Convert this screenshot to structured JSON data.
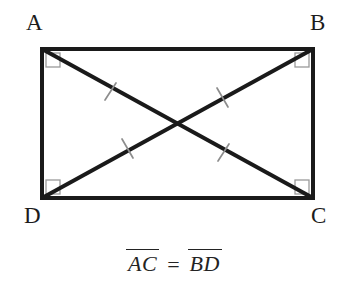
{
  "figure": {
    "shape": "rectangle",
    "background_color": "#ffffff",
    "stroke_color": "#1a1a1a",
    "right_angle_marker_color": "#9a9a9a",
    "tick_mark_color": "#8d8d8d",
    "rect": {
      "left": 42,
      "top": 49,
      "right": 313,
      "bottom": 198,
      "width": 271,
      "height": 149,
      "stroke_width": 4
    },
    "vertices": [
      {
        "name": "A",
        "label": "A",
        "position": "top-left",
        "x": 42,
        "y": 49,
        "right_angle": true
      },
      {
        "name": "B",
        "label": "B",
        "position": "top-right",
        "x": 313,
        "y": 49,
        "right_angle": true
      },
      {
        "name": "C",
        "label": "C",
        "position": "bottom-right",
        "x": 313,
        "y": 198,
        "right_angle": true
      },
      {
        "name": "D",
        "label": "D",
        "position": "bottom-left",
        "x": 42,
        "y": 198,
        "right_angle": true
      }
    ],
    "diagonals": [
      {
        "name": "AC",
        "from": "A",
        "to": "C",
        "stroke_width": 4,
        "tick_count": 2
      },
      {
        "name": "BD",
        "from": "B",
        "to": "D",
        "stroke_width": 4,
        "tick_count": 2
      }
    ],
    "intersection": {
      "x": 177,
      "y": 123
    },
    "tick_marks": [
      {
        "on_diagonal": "AC",
        "x": 110,
        "y": 92,
        "label": "congruence-tick"
      },
      {
        "on_diagonal": "AC",
        "x": 223,
        "y": 153,
        "label": "congruence-tick"
      },
      {
        "on_diagonal": "BD",
        "x": 223,
        "y": 97,
        "label": "congruence-tick"
      },
      {
        "on_diagonal": "BD",
        "x": 128,
        "y": 148,
        "label": "congruence-tick"
      }
    ],
    "right_angle_markers": [
      {
        "at_vertex": "A",
        "x": 46,
        "y": 53,
        "size": 14
      },
      {
        "at_vertex": "B",
        "x": 295,
        "y": 53,
        "size": 14
      },
      {
        "at_vertex": "C",
        "x": 295,
        "y": 180,
        "size": 14
      },
      {
        "at_vertex": "D",
        "x": 46,
        "y": 180,
        "size": 14
      }
    ]
  },
  "equation": {
    "left_term": "AC",
    "operator": "=",
    "right_term": "BD",
    "full_text": "AC = BD",
    "notation": "overbar-segment"
  }
}
